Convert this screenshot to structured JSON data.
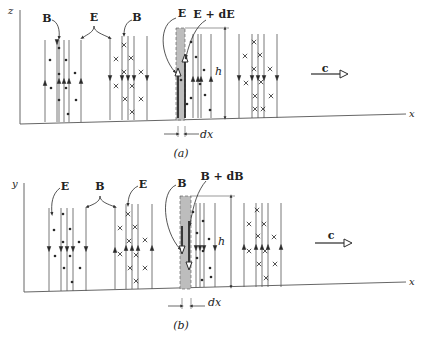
{
  "colors": {
    "ink": "#2a2a2a",
    "line": "#555555",
    "shade": "#bdbdbd",
    "background": "#ffffff"
  },
  "panels": [
    {
      "id": "a",
      "caption": "(a)",
      "caption_pos": [
        181,
        157
      ],
      "vertical_axis_label": "z",
      "horizontal_axis_label": "x",
      "axis_origin": [
        20,
        124
      ],
      "axis_top": [
        20,
        10
      ],
      "axis_end": [
        406,
        114
      ],
      "labels": [
        {
          "text": "B",
          "x": 47,
          "y": 22,
          "bold": true
        },
        {
          "text": "E",
          "x": 94,
          "y": 21,
          "bold": true
        },
        {
          "text": "B",
          "x": 137,
          "y": 21,
          "bold": true
        },
        {
          "text": "E",
          "x": 182,
          "y": 17,
          "bold": true
        },
        {
          "text": "E + dE",
          "x": 214,
          "y": 18,
          "bold": true
        }
      ],
      "h_label": {
        "text": "h",
        "x": 224,
        "y": 75
      },
      "dx_label": {
        "text": "dx",
        "x": 207,
        "y": 135
      },
      "c_label": {
        "text": "c",
        "x": 325,
        "y": 72
      },
      "c_arrow": {
        "x1": 311,
        "y1": 74,
        "x2": 348,
        "y2": 74
      },
      "strip": {
        "x": 176,
        "y": 28,
        "w": 9,
        "h": 92
      },
      "h_dim": {
        "x": 225,
        "top": 28,
        "bottom": 118
      },
      "dx_dim": {
        "left": 178,
        "right": 185,
        "y": 134
      },
      "field_lines": [
        {
          "x": 45,
          "top": 40,
          "bottom": 122,
          "dir": "up",
          "ay": 83
        },
        {
          "x": 57,
          "top": 40,
          "bottom": 122,
          "dir": "down",
          "ay": 42
        },
        {
          "x": 59,
          "top": 40,
          "bottom": 122,
          "dir": "up",
          "ay": 81
        },
        {
          "x": 64,
          "top": 40,
          "bottom": 122,
          "dir": "up",
          "ay": 81
        },
        {
          "x": 69,
          "top": 40,
          "bottom": 122,
          "dir": "up",
          "ay": 81
        },
        {
          "x": 81,
          "top": 40,
          "bottom": 122,
          "dir": "up",
          "ay": 81
        },
        {
          "x": 110,
          "top": 38,
          "bottom": 120,
          "dir": "down",
          "ay": 78
        },
        {
          "x": 122,
          "top": 36,
          "bottom": 120,
          "dir": "down",
          "ay": 78
        },
        {
          "x": 128,
          "top": 36,
          "bottom": 120,
          "dir": "down",
          "ay": 78
        },
        {
          "x": 134,
          "top": 36,
          "bottom": 120,
          "dir": "down",
          "ay": 78
        },
        {
          "x": 147,
          "top": 36,
          "bottom": 120,
          "dir": "down",
          "ay": 78
        },
        {
          "x": 193,
          "top": 34,
          "bottom": 118,
          "dir": "up",
          "ay": 79
        },
        {
          "x": 198,
          "top": 34,
          "bottom": 118,
          "dir": "up",
          "ay": 79
        },
        {
          "x": 201,
          "top": 34,
          "bottom": 118,
          "dir": "up",
          "ay": 79
        },
        {
          "x": 211,
          "top": 34,
          "bottom": 118,
          "dir": "up",
          "ay": 79
        },
        {
          "x": 239,
          "top": 34,
          "bottom": 118,
          "dir": "down",
          "ay": 78
        },
        {
          "x": 252,
          "top": 34,
          "bottom": 118,
          "dir": "down",
          "ay": 78
        },
        {
          "x": 258,
          "top": 34,
          "bottom": 118,
          "dir": "down",
          "ay": 78
        },
        {
          "x": 264,
          "top": 34,
          "bottom": 118,
          "dir": "down",
          "ay": 78
        },
        {
          "x": 277,
          "top": 34,
          "bottom": 118,
          "dir": "down",
          "ay": 78
        }
      ],
      "strip_lines": [
        {
          "x": 178,
          "top": 72,
          "bottom": 118,
          "ay": 72
        },
        {
          "x": 185,
          "top": 58,
          "bottom": 118,
          "ay": 58
        }
      ],
      "dots": [
        [
          50,
          60
        ],
        [
          51,
          88
        ],
        [
          59,
          48
        ],
        [
          59,
          74
        ],
        [
          59,
          100
        ],
        [
          66,
          60
        ],
        [
          66,
          88
        ],
        [
          68,
          114
        ],
        [
          75,
          73
        ],
        [
          76,
          100
        ],
        [
          181,
          80
        ],
        [
          186,
          58
        ],
        [
          187,
          104
        ],
        [
          191,
          42
        ],
        [
          191,
          98
        ],
        [
          196,
          57
        ],
        [
          200,
          84
        ],
        [
          204,
          70
        ],
        [
          205,
          95
        ],
        [
          210,
          110
        ]
      ],
      "crosses": [
        [
          116,
          59
        ],
        [
          116,
          86
        ],
        [
          124,
          45
        ],
        [
          124,
          72
        ],
        [
          125,
          99
        ],
        [
          131,
          58
        ],
        [
          132,
          86
        ],
        [
          132,
          112
        ],
        [
          141,
          72
        ],
        [
          141,
          99
        ],
        [
          245,
          56
        ],
        [
          246,
          83
        ],
        [
          254,
          42
        ],
        [
          254,
          69
        ],
        [
          255,
          96
        ],
        [
          260,
          55
        ],
        [
          261,
          82
        ],
        [
          263,
          109
        ],
        [
          270,
          69
        ],
        [
          271,
          96
        ],
        [
          255,
          109
        ]
      ]
    },
    {
      "id": "b",
      "caption": "(b)",
      "caption_pos": [
        181,
        329
      ],
      "vertical_axis_label": "y",
      "horizontal_axis_label": "x",
      "axis_origin": [
        24,
        292
      ],
      "axis_top": [
        24,
        183
      ],
      "axis_end": [
        406,
        282
      ],
      "labels": [
        {
          "text": "E",
          "x": 65,
          "y": 190,
          "bold": true
        },
        {
          "text": "B",
          "x": 100,
          "y": 190,
          "bold": true
        },
        {
          "text": "E",
          "x": 143,
          "y": 188,
          "bold": true
        },
        {
          "text": "B",
          "x": 182,
          "y": 187,
          "bold": true
        },
        {
          "text": "B + dB",
          "x": 222,
          "y": 180,
          "bold": true
        }
      ],
      "h_label": {
        "text": "h",
        "x": 227,
        "y": 245
      },
      "dx_label": {
        "text": "dx",
        "x": 215,
        "y": 303
      },
      "c_label": {
        "text": "c",
        "x": 331,
        "y": 239
      },
      "c_arrow": {
        "x1": 315,
        "y1": 243,
        "x2": 352,
        "y2": 243
      },
      "strip": {
        "x": 180,
        "y": 196,
        "w": 11,
        "h": 93
      },
      "h_dim": {
        "x": 231,
        "top": 196,
        "bottom": 287
      },
      "dx_dim": {
        "left": 182,
        "right": 191,
        "y": 306
      },
      "field_lines": [
        {
          "x": 49,
          "top": 208,
          "bottom": 291,
          "dir": "down",
          "ay": 249
        },
        {
          "x": 61,
          "top": 208,
          "bottom": 291,
          "dir": "down",
          "ay": 249
        },
        {
          "x": 67,
          "top": 208,
          "bottom": 291,
          "dir": "down",
          "ay": 249
        },
        {
          "x": 73,
          "top": 208,
          "bottom": 291,
          "dir": "down",
          "ay": 249
        },
        {
          "x": 86,
          "top": 208,
          "bottom": 291,
          "dir": "down",
          "ay": 249
        },
        {
          "x": 115,
          "top": 206,
          "bottom": 289,
          "dir": "up",
          "ay": 250
        },
        {
          "x": 126,
          "top": 204,
          "bottom": 289,
          "dir": "up",
          "ay": 248
        },
        {
          "x": 132,
          "top": 204,
          "bottom": 289,
          "dir": "up",
          "ay": 248
        },
        {
          "x": 138,
          "top": 204,
          "bottom": 289,
          "dir": "up",
          "ay": 248
        },
        {
          "x": 152,
          "top": 204,
          "bottom": 289,
          "dir": "up",
          "ay": 248
        },
        {
          "x": 196,
          "top": 203,
          "bottom": 287,
          "dir": "down",
          "ay": 248
        },
        {
          "x": 200,
          "top": 203,
          "bottom": 287,
          "dir": "down",
          "ay": 248
        },
        {
          "x": 204,
          "top": 203,
          "bottom": 287,
          "dir": "down",
          "ay": 248
        },
        {
          "x": 215,
          "top": 203,
          "bottom": 287,
          "dir": "down",
          "ay": 248
        },
        {
          "x": 244,
          "top": 203,
          "bottom": 287,
          "dir": "up",
          "ay": 247
        },
        {
          "x": 256,
          "top": 203,
          "bottom": 287,
          "dir": "up",
          "ay": 247
        },
        {
          "x": 262,
          "top": 203,
          "bottom": 287,
          "dir": "up",
          "ay": 247
        },
        {
          "x": 268,
          "top": 203,
          "bottom": 287,
          "dir": "up",
          "ay": 247
        },
        {
          "x": 281,
          "top": 203,
          "bottom": 287,
          "dir": "up",
          "ay": 247
        }
      ],
      "strip_lines": [
        {
          "x": 182,
          "top": 226,
          "bottom": 250,
          "ay": 250
        },
        {
          "x": 189,
          "top": 221,
          "bottom": 266,
          "ay": 266
        }
      ],
      "dots": [
        [
          54,
          230
        ],
        [
          55,
          256
        ],
        [
          63,
          214
        ],
        [
          63,
          242
        ],
        [
          64,
          268
        ],
        [
          70,
          229
        ],
        [
          70,
          256
        ],
        [
          72,
          282
        ],
        [
          79,
          242
        ],
        [
          80,
          268
        ],
        [
          193,
          212
        ],
        [
          197,
          233
        ],
        [
          197,
          258
        ],
        [
          203,
          221
        ],
        [
          203,
          251
        ],
        [
          209,
          239
        ],
        [
          210,
          268
        ],
        [
          211,
          277
        ],
        [
          202,
          280
        ]
      ],
      "crosses": [
        [
          120,
          228
        ],
        [
          120,
          254
        ],
        [
          128,
          214
        ],
        [
          129,
          241
        ],
        [
          130,
          268
        ],
        [
          135,
          227
        ],
        [
          136,
          255
        ],
        [
          136,
          281
        ],
        [
          145,
          240
        ],
        [
          145,
          268
        ],
        [
          249,
          224
        ],
        [
          249,
          251
        ],
        [
          257,
          210
        ],
        [
          258,
          236
        ],
        [
          259,
          264
        ],
        [
          264,
          224
        ],
        [
          265,
          251
        ],
        [
          266,
          278
        ],
        [
          274,
          237
        ],
        [
          275,
          264
        ]
      ]
    }
  ]
}
